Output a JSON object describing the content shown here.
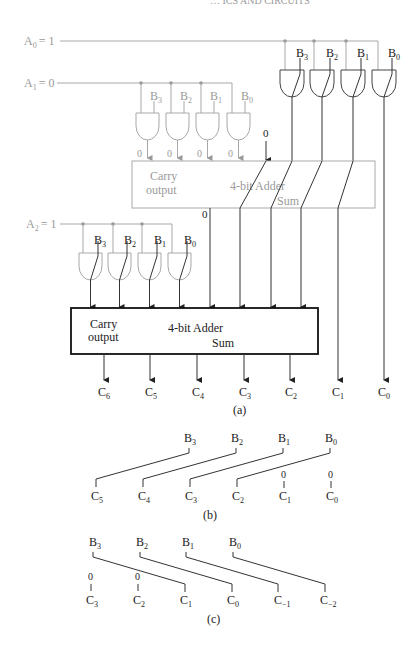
{
  "header_fragment": "… ICS AND CIRCUITS",
  "part_a": {
    "caption": "(a)",
    "inputs": [
      {
        "label": "A",
        "sub": "0",
        "value": "= 1"
      },
      {
        "label": "A",
        "sub": "1",
        "value": "= 0"
      },
      {
        "label": "A",
        "sub": "2",
        "value": "= 1"
      }
    ],
    "b_labels": [
      {
        "label": "B",
        "sub": "3"
      },
      {
        "label": "B",
        "sub": "2"
      },
      {
        "label": "B",
        "sub": "1"
      },
      {
        "label": "B",
        "sub": "0"
      }
    ],
    "zero_inputs": [
      "0",
      "0",
      "0",
      "0"
    ],
    "carry_in_zero": "0",
    "carry_out_zero": "0",
    "adder1": {
      "title": "4-bit Adder",
      "carry_label_1": "Carry",
      "carry_label_2": "output",
      "sum_label": "Sum"
    },
    "adder2": {
      "title": "4-bit Adder",
      "carry_label_1": "Carry",
      "carry_label_2": "output",
      "sum_label": "Sum"
    },
    "outputs": [
      {
        "label": "C",
        "sub": "6"
      },
      {
        "label": "C",
        "sub": "5"
      },
      {
        "label": "C",
        "sub": "4"
      },
      {
        "label": "C",
        "sub": "3"
      },
      {
        "label": "C",
        "sub": "2"
      },
      {
        "label": "C",
        "sub": "1"
      },
      {
        "label": "C",
        "sub": "0"
      }
    ]
  },
  "part_b": {
    "caption": "(b)",
    "b_labels": [
      {
        "label": "B",
        "sub": "3"
      },
      {
        "label": "B",
        "sub": "2"
      },
      {
        "label": "B",
        "sub": "1"
      },
      {
        "label": "B",
        "sub": "0"
      }
    ],
    "c_labels": [
      {
        "label": "C",
        "sub": "5"
      },
      {
        "label": "C",
        "sub": "4"
      },
      {
        "label": "C",
        "sub": "3"
      },
      {
        "label": "C",
        "sub": "2"
      },
      {
        "label": "C",
        "sub": "1"
      },
      {
        "label": "C",
        "sub": "0"
      }
    ],
    "zeros": [
      "0",
      "0"
    ]
  },
  "part_c": {
    "caption": "(c)",
    "b_labels": [
      {
        "label": "B",
        "sub": "3"
      },
      {
        "label": "B",
        "sub": "2"
      },
      {
        "label": "B",
        "sub": "1"
      },
      {
        "label": "B",
        "sub": "0"
      }
    ],
    "c_labels": [
      {
        "label": "C",
        "sub": "3"
      },
      {
        "label": "C",
        "sub": "2"
      },
      {
        "label": "C",
        "sub": "1"
      },
      {
        "label": "C",
        "sub": "0"
      },
      {
        "label": "C",
        "sub": "−1"
      },
      {
        "label": "C",
        "sub": "−2"
      }
    ],
    "zeros": [
      "0",
      "0"
    ]
  }
}
